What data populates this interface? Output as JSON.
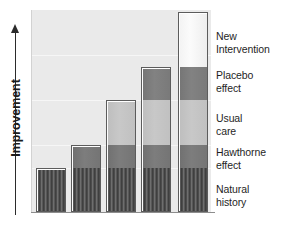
{
  "axis": {
    "y_title": "Improvement",
    "arrow": "up-arrow"
  },
  "labels": [
    {
      "id": "new-intervention",
      "line1": "New",
      "line2": "Intervention",
      "top": 30
    },
    {
      "id": "placebo-effect",
      "line1": "Placebo",
      "line2": "effect",
      "top": 69
    },
    {
      "id": "usual-care",
      "line1": "Usual",
      "line2": "care",
      "top": 112
    },
    {
      "id": "hawthorne-effect",
      "line1": "Hawthorne",
      "line2": "effect",
      "top": 146
    },
    {
      "id": "natural-history",
      "line1": "Natural",
      "line2": "history",
      "top": 183
    }
  ],
  "chart_data": {
    "type": "bar",
    "title": "",
    "xlabel": "",
    "ylabel": "Improvement",
    "grid": true,
    "legend_position": "right-of-plot",
    "stacked": true,
    "categories": [
      "Natural history only",
      "+ Hawthorne effect",
      "+ Usual care",
      "+ Placebo effect",
      "+ New Intervention"
    ],
    "segments": [
      {
        "name": "Natural history",
        "color": "#4c4c4c",
        "pattern": "vertical-stripes"
      },
      {
        "name": "Hawthorne effect",
        "color": "#7a7a7a",
        "pattern": "solid"
      },
      {
        "name": "Usual care",
        "color": "#c3c3c3",
        "pattern": "solid"
      },
      {
        "name": "Placebo effect",
        "color": "#7c7c7c",
        "pattern": "solid"
      },
      {
        "name": "New Intervention",
        "color": "#f5f5f5",
        "pattern": "solid"
      }
    ],
    "series": [
      {
        "name": "Natural history",
        "values": [
          44,
          44,
          44,
          44,
          44
        ]
      },
      {
        "name": "Hawthorne effect",
        "values": [
          0,
          23,
          23,
          23,
          23
        ]
      },
      {
        "name": "Usual care",
        "values": [
          0,
          0,
          45,
          45,
          45
        ]
      },
      {
        "name": "Placebo effect",
        "values": [
          0,
          0,
          0,
          33,
          33
        ]
      },
      {
        "name": "New Intervention",
        "values": [
          0,
          0,
          0,
          0,
          55
        ]
      }
    ],
    "totals": [
      44,
      67,
      112,
      145,
      200
    ],
    "ylim": [
      0,
      202
    ],
    "units": "relative improvement (arbitrary units)"
  },
  "bars": [
    {
      "id": "bar-1",
      "left": 4,
      "width": 30,
      "segments": [
        {
          "cls": "natural",
          "h": 44
        }
      ]
    },
    {
      "id": "bar-2",
      "left": 39,
      "width": 30,
      "segments": [
        {
          "cls": "natural",
          "h": 44
        },
        {
          "cls": "hawthorne",
          "h": 23
        }
      ]
    },
    {
      "id": "bar-3",
      "left": 74,
      "width": 30,
      "segments": [
        {
          "cls": "natural",
          "h": 44
        },
        {
          "cls": "hawthorne",
          "h": 23
        },
        {
          "cls": "usual",
          "h": 45
        }
      ]
    },
    {
      "id": "bar-4",
      "left": 109,
      "width": 30,
      "segments": [
        {
          "cls": "natural",
          "h": 44
        },
        {
          "cls": "hawthorne",
          "h": 23
        },
        {
          "cls": "usual",
          "h": 45
        },
        {
          "cls": "placebo",
          "h": 33
        }
      ]
    },
    {
      "id": "bar-5",
      "left": 146,
      "width": 30,
      "segments": [
        {
          "cls": "natural",
          "h": 44
        },
        {
          "cls": "hawthorne",
          "h": 23
        },
        {
          "cls": "usual",
          "h": 45
        },
        {
          "cls": "placebo",
          "h": 33
        },
        {
          "cls": "newint",
          "h": 55
        }
      ]
    }
  ],
  "gridlines": [
    45,
    90,
    135,
    158
  ]
}
